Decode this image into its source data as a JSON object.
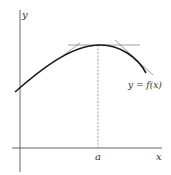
{
  "diagram": {
    "labels": {
      "y_axis": "y",
      "x_axis": "x",
      "point_a": "a",
      "function": "y = f(x)"
    },
    "colors": {
      "curve": "#1a1a1a",
      "axes": "#555555",
      "tangents": "#777777",
      "dashed": "#888888"
    }
  }
}
